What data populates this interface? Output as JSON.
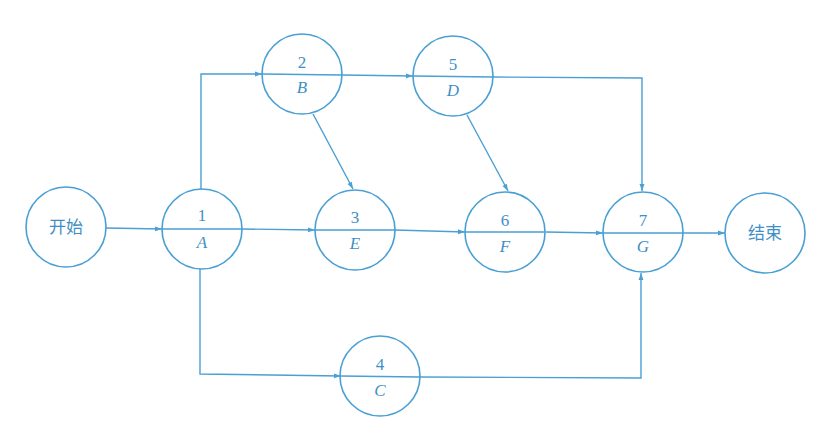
{
  "diagram": {
    "type": "activity-on-node network",
    "line_color": "#4a9fd4",
    "text_color": "#3f8fc6",
    "nodes": [
      {
        "id": "start",
        "label": "开始"
      },
      {
        "id": "1",
        "number": "1",
        "activity": "A"
      },
      {
        "id": "2",
        "number": "2",
        "activity": "B"
      },
      {
        "id": "3",
        "number": "3",
        "activity": "E"
      },
      {
        "id": "4",
        "number": "4",
        "activity": "C"
      },
      {
        "id": "5",
        "number": "5",
        "activity": "D"
      },
      {
        "id": "6",
        "number": "6",
        "activity": "F"
      },
      {
        "id": "7",
        "number": "7",
        "activity": "G"
      },
      {
        "id": "end",
        "label": "结束"
      }
    ],
    "edges": [
      {
        "from": "start",
        "to": "1"
      },
      {
        "from": "1",
        "to": "2"
      },
      {
        "from": "1",
        "to": "3"
      },
      {
        "from": "1",
        "to": "4"
      },
      {
        "from": "2",
        "to": "5"
      },
      {
        "from": "2",
        "to": "3"
      },
      {
        "from": "3",
        "to": "6"
      },
      {
        "from": "5",
        "to": "6"
      },
      {
        "from": "5",
        "to": "7"
      },
      {
        "from": "6",
        "to": "7"
      },
      {
        "from": "4",
        "to": "7"
      },
      {
        "from": "7",
        "to": "end"
      }
    ]
  }
}
